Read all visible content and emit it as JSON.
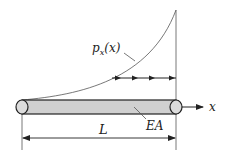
{
  "diagram": {
    "load_label": {
      "base": "p",
      "sub": "x",
      "arg": "(x)"
    },
    "stiffness_label": "EA",
    "length_label": "L",
    "axis_label": "x",
    "load_distribution": "increasing (nonlinear, concave up) from 0 at left end to maximum at right end",
    "load_arrows_count": 4,
    "colors": {
      "line": "#333333",
      "bar_fill": "#d0d0d0",
      "end_fill": "#dcdcdc",
      "background": "#ffffff"
    }
  }
}
